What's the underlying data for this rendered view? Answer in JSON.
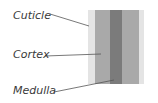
{
  "diagram": {
    "labels": {
      "cuticle": "Cuticle",
      "cortex": "Cortex",
      "medulla": "Medulla"
    },
    "colors": {
      "cuticle": "#e4e4e4",
      "cortex": "#a9a9a9",
      "medulla": "#7b7b7b",
      "leader": "#555555",
      "text": "#3a3a3a"
    }
  }
}
